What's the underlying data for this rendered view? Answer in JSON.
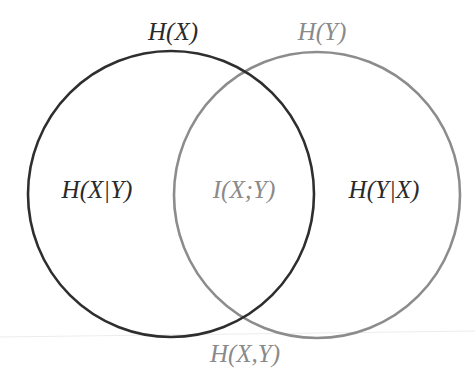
{
  "diagram": {
    "type": "venn",
    "colors": {
      "set_x": "#2e2e2e",
      "set_y": "#8c8c8c",
      "text_dark": "#2a2a2a",
      "text_light": "#8a8a8a"
    },
    "sets": [
      {
        "id": "X",
        "label": "H(X)"
      },
      {
        "id": "Y",
        "label": "H(Y)"
      }
    ],
    "regions": {
      "x_only": "H(X|Y)",
      "intersection": "I(X;Y)",
      "y_only": "H(Y|X)"
    },
    "union_label": "H(X,Y)"
  }
}
